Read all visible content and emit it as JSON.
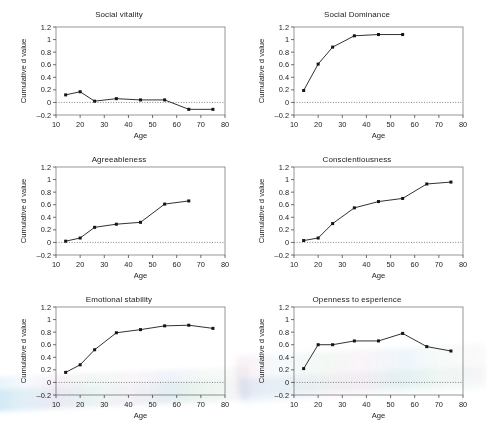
{
  "figure": {
    "background": "#ffffff",
    "line_color": "#1a1a1a",
    "marker_color": "#141414",
    "zero_line_color": "#555555",
    "panel_count": 6
  },
  "axis": {
    "xlabel": "Age",
    "ylabel": "Cumulative d value",
    "xticks": [
      "10",
      "20",
      "30",
      "40",
      "50",
      "60",
      "70",
      "80"
    ],
    "yticks": [
      "1.2",
      "1",
      "0.8",
      "0.6",
      "0.4",
      "0.2",
      "0",
      "-0.2"
    ],
    "xlim": [
      10,
      80
    ],
    "ylim": [
      -0.2,
      1.2
    ]
  },
  "chart_data": [
    {
      "type": "line",
      "title": "Social vitality",
      "xlabel": "Age",
      "ylabel": "Cumulative d value",
      "xlim": [
        10,
        80
      ],
      "ylim": [
        -0.2,
        1.2
      ],
      "grid": false,
      "legend": "none",
      "x": [
        14,
        20,
        26,
        35,
        45,
        55,
        65,
        75
      ],
      "values": [
        0.12,
        0.17,
        0.02,
        0.06,
        0.04,
        0.04,
        -0.11,
        -0.11
      ]
    },
    {
      "type": "line",
      "title": "Social Dominance",
      "xlabel": "Age",
      "ylabel": "Cumulative d value",
      "xlim": [
        10,
        80
      ],
      "ylim": [
        -0.2,
        1.2
      ],
      "grid": false,
      "legend": "none",
      "x": [
        14,
        20,
        26,
        35,
        45,
        55
      ],
      "values": [
        0.19,
        0.61,
        0.88,
        1.06,
        1.08,
        1.08
      ]
    },
    {
      "type": "line",
      "title": "Agreeableness",
      "xlabel": "Age",
      "ylabel": "Cumulative d value",
      "xlim": [
        10,
        80
      ],
      "ylim": [
        -0.2,
        1.2
      ],
      "grid": false,
      "legend": "none",
      "x": [
        14,
        20,
        26,
        35,
        45,
        55,
        65
      ],
      "values": [
        0.02,
        0.07,
        0.24,
        0.29,
        0.32,
        0.61,
        0.66
      ]
    },
    {
      "type": "line",
      "title": "Conscientiousness",
      "xlabel": "Age",
      "ylabel": "Cumulative d value",
      "xlim": [
        10,
        80
      ],
      "ylim": [
        -0.2,
        1.2
      ],
      "grid": false,
      "legend": "none",
      "x": [
        14,
        20,
        26,
        35,
        45,
        55,
        65,
        75
      ],
      "values": [
        0.03,
        0.07,
        0.3,
        0.55,
        0.65,
        0.7,
        0.93,
        0.96
      ]
    },
    {
      "type": "line",
      "title": "Emotional stability",
      "xlabel": "Age",
      "ylabel": "Cumulative d value",
      "xlim": [
        10,
        80
      ],
      "ylim": [
        -0.2,
        1.2
      ],
      "grid": false,
      "legend": "none",
      "x": [
        14,
        20,
        26,
        35,
        45,
        55,
        65,
        75
      ],
      "values": [
        0.16,
        0.28,
        0.52,
        0.79,
        0.84,
        0.9,
        0.91,
        0.86
      ]
    },
    {
      "type": "line",
      "title": "Openness to esperience",
      "xlabel": "Age",
      "ylabel": "Cumulative d value",
      "xlim": [
        10,
        80
      ],
      "ylim": [
        -0.2,
        1.2
      ],
      "grid": false,
      "legend": "none",
      "x": [
        14,
        20,
        26,
        35,
        45,
        55,
        65,
        75
      ],
      "values": [
        0.22,
        0.6,
        0.6,
        0.66,
        0.66,
        0.78,
        0.57,
        0.5
      ]
    }
  ]
}
